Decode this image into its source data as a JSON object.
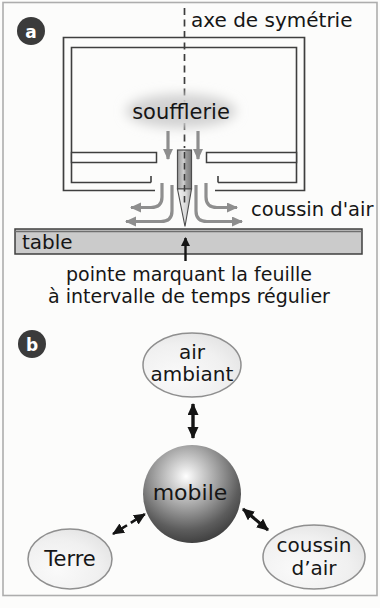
{
  "figure_title": "air-table physics schematic",
  "colors": {
    "ink": "#1a1a1a",
    "diagram_line": "#3f3f3f",
    "air_arrow_gray": "#8e8e8e",
    "table_fill": "#cbcbcb",
    "badge_background": "#3b3b3b",
    "bubble_fill": "#efefef",
    "frame_border": "#adadad"
  },
  "panel_a": {
    "badge": "a",
    "axis_label": "axe de symétrie",
    "blower_label": "soufflerie",
    "air_cushion_label": "coussin d'air",
    "table_label": "table",
    "caption_line1": "pointe marquant la feuille",
    "caption_line2": "à intervalle de temps régulier"
  },
  "panel_b": {
    "badge": "b",
    "nodes": {
      "top": {
        "line1": "air",
        "line2": "ambiant"
      },
      "center": "mobile",
      "left": "Terre",
      "right": {
        "line1": "coussin",
        "line2": "d’air"
      }
    }
  }
}
